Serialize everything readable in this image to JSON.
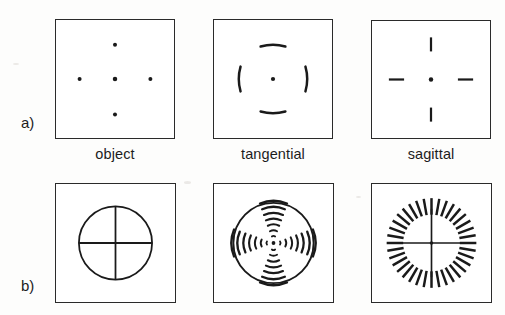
{
  "figure": {
    "ink_color": "#1a1a1a",
    "background_color": "#ffffff",
    "rows": [
      {
        "id": "a",
        "label": "a)"
      },
      {
        "id": "b",
        "label": "b)"
      }
    ],
    "column_captions": [
      {
        "id": "object",
        "label": "object"
      },
      {
        "id": "tangential",
        "label": "tangential"
      },
      {
        "id": "sagittal",
        "label": "sagittal"
      }
    ]
  },
  "panels": {
    "a_object": {
      "name": "object-point-pattern",
      "description": "five points arranged as a cross",
      "marks": "5 dots",
      "dot_positions": [
        {
          "x": 50,
          "y": 50
        },
        {
          "x": 50,
          "y": 20
        },
        {
          "x": 50,
          "y": 80
        },
        {
          "x": 20,
          "y": 50
        },
        {
          "x": 80,
          "y": 50
        }
      ],
      "dot_radius": 1.9
    },
    "a_tangential": {
      "name": "tangential-image-pattern",
      "description": "center dot with four arcs oriented tangentially (perpendicular to the radius)",
      "marks": "1 dot + 4 tangential arcs",
      "center": {
        "x": 50,
        "y": 50
      },
      "arc_offsets": [
        20,
        20,
        20,
        20
      ]
    },
    "a_sagittal": {
      "name": "sagittal-image-pattern",
      "description": "center dot with four dashes oriented radially (along the radius)",
      "marks": "1 dot + 4 radial dashes",
      "center": {
        "x": 50,
        "y": 50
      },
      "dash_offsets": [
        22,
        22,
        22,
        22
      ]
    },
    "b_object": {
      "name": "object-circle-cross",
      "description": "circle with horizontal and vertical diameters",
      "marks": "circle + crosshair",
      "circle_radius": 31
    },
    "b_tangential": {
      "name": "tangential-blur-circle",
      "description": "circle whose cross is broken into tangential arc segments increasing in length outward",
      "marks": "circle + tangential arc segments",
      "circle_radius": 34,
      "segments_per_arm": 7
    },
    "b_sagittal": {
      "name": "sagittal-blur-circle",
      "description": "ring of radial dashes around a crosshair",
      "marks": "36 radial dashes + crosshair",
      "tick_count": 36,
      "tick_inner_radius": 24,
      "tick_outer_radius": 38
    }
  }
}
